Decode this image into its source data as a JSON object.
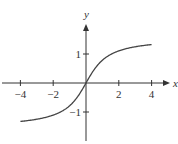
{
  "chart_data": {
    "type": "line",
    "title": "",
    "function": "y = arctan(x)",
    "xlabel": "x",
    "ylabel": "y",
    "xlim": [
      -5.2,
      5.5
    ],
    "ylim": [
      -2.2,
      2.6
    ],
    "x_ticks": [
      -4,
      -2,
      2,
      4
    ],
    "x_tick_labels": [
      "−4",
      "−2",
      "2",
      "4"
    ],
    "y_ticks": [
      1,
      -1
    ],
    "y_tick_labels": [
      "1",
      "−1"
    ],
    "grid": false,
    "legend": null,
    "series": [
      {
        "name": "arctan(x)",
        "x": [
          -4,
          -3,
          -2,
          -1.5,
          -1,
          -0.5,
          0,
          0.5,
          1,
          1.5,
          2,
          3,
          4
        ],
        "values": [
          -1.33,
          -1.25,
          -1.11,
          -0.98,
          -0.79,
          -0.46,
          0,
          0.46,
          0.79,
          0.98,
          1.11,
          1.25,
          1.33
        ]
      }
    ]
  },
  "layout": {
    "origin_px": [
      86,
      83
    ],
    "x_scale_px": 16.4,
    "y_scale_px": 29,
    "colors": {
      "axis": "#333333",
      "curve": "#444444"
    }
  }
}
